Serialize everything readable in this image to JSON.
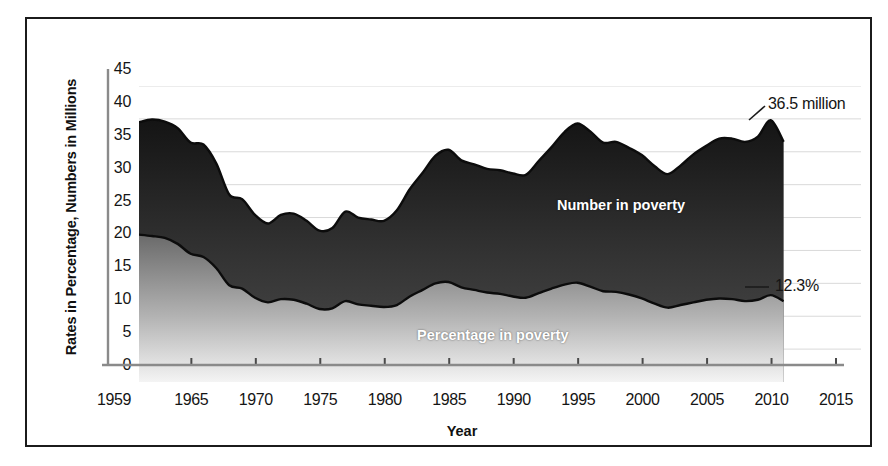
{
  "figure": {
    "xlabel": "Year",
    "ylabel": "Rates in Percentage, Numbers in Millions",
    "series_label_number": "Number in poverty",
    "series_label_percentage": "Percentage in poverty",
    "callout_number": "36.5 million",
    "callout_percentage": "12.3%"
  },
  "axes": {
    "y_ticks": [
      "45",
      "40",
      "35",
      "30",
      "25",
      "20",
      "15",
      "10",
      "5",
      "0"
    ],
    "x_ticks": [
      "1959",
      "1965",
      "1970",
      "1975",
      "1980",
      "1985",
      "1990",
      "1995",
      "2000",
      "2005",
      "2010",
      "2015"
    ]
  },
  "colors": {
    "frame": "#1b1b1b",
    "number_area_top": "#1d1d1d",
    "number_area_bottom": "#5a5a5a",
    "percentage_area_top": "#6b6b6b",
    "percentage_area_bottom": "#f2f2f2",
    "gridline": "#d9d9d9",
    "axis": "#8a8a8a",
    "label_text": "#151515",
    "series_text": "#ffffff"
  },
  "chart_data": {
    "type": "area",
    "title": "",
    "subtitle": "",
    "xlabel": "Year",
    "ylabel": "Rates in Percentage, Numbers in Millions",
    "xlim": [
      1959,
      2015
    ],
    "ylim": [
      0,
      45
    ],
    "grid": true,
    "legend": "inline-labels",
    "annotations": [
      {
        "text": "36.5 million",
        "series": "Number in poverty",
        "x": 2009,
        "y": 36.5
      },
      {
        "text": "12.3%",
        "series": "Percentage in poverty",
        "x": 2009,
        "y": 12.3
      }
    ],
    "x": [
      1959,
      1960,
      1961,
      1962,
      1963,
      1964,
      1965,
      1966,
      1967,
      1968,
      1969,
      1970,
      1971,
      1972,
      1973,
      1974,
      1975,
      1976,
      1977,
      1978,
      1979,
      1980,
      1981,
      1982,
      1983,
      1984,
      1985,
      1986,
      1987,
      1988,
      1989,
      1990,
      1991,
      1992,
      1993,
      1994,
      1995,
      1996,
      1997,
      1998,
      1999,
      2000,
      2001,
      2002,
      2003,
      2004,
      2005,
      2006,
      2007,
      2008,
      2009
    ],
    "series": [
      {
        "name": "Number in poverty",
        "unit": "millions",
        "values": [
          39.5,
          39.9,
          39.6,
          38.6,
          36.4,
          36.1,
          33.2,
          28.5,
          27.8,
          25.4,
          24.1,
          25.4,
          25.6,
          24.5,
          23.0,
          23.4,
          25.9,
          25.0,
          24.7,
          24.5,
          26.1,
          29.3,
          31.8,
          34.4,
          35.3,
          33.7,
          33.1,
          32.4,
          32.2,
          31.7,
          31.5,
          33.6,
          35.7,
          38.0,
          39.3,
          38.1,
          36.4,
          36.5,
          35.6,
          34.5,
          32.8,
          31.6,
          32.9,
          34.6,
          35.9,
          37.0,
          37.0,
          36.5,
          37.3,
          39.8,
          36.5
        ]
      },
      {
        "name": "Percentage in poverty",
        "unit": "percent",
        "values": [
          22.4,
          22.2,
          21.9,
          21.0,
          19.5,
          19.0,
          17.3,
          14.7,
          14.2,
          12.8,
          12.1,
          12.6,
          12.5,
          11.9,
          11.1,
          11.2,
          12.3,
          11.8,
          11.6,
          11.4,
          11.7,
          13.0,
          14.0,
          15.0,
          15.2,
          14.4,
          14.0,
          13.6,
          13.4,
          13.0,
          12.8,
          13.5,
          14.2,
          14.8,
          15.1,
          14.5,
          13.8,
          13.7,
          13.3,
          12.7,
          11.9,
          11.3,
          11.7,
          12.1,
          12.5,
          12.7,
          12.6,
          12.3,
          12.5,
          13.2,
          12.3
        ]
      }
    ]
  }
}
